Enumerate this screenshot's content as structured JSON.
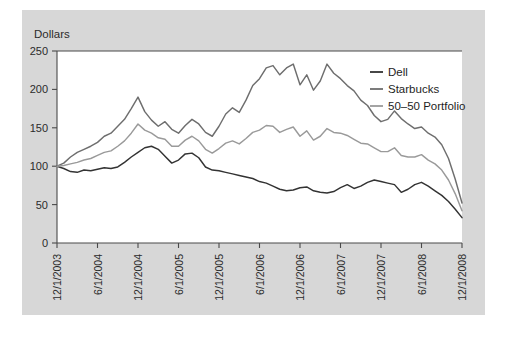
{
  "chart_data": {
    "type": "line",
    "title": "",
    "ylabel": "Dollars",
    "xlabel": "",
    "ylim": [
      0,
      250
    ],
    "yticks": [
      0,
      50,
      100,
      150,
      200,
      250
    ],
    "ytick_labels": [
      "0",
      "50",
      "100",
      "150",
      "200",
      "250"
    ],
    "grid": false,
    "legend_position": "top-right",
    "categories": [
      "12/1/2003",
      "1/1/2004",
      "2/1/2004",
      "3/1/2004",
      "4/1/2004",
      "5/1/2004",
      "6/1/2004",
      "7/1/2004",
      "8/1/2004",
      "9/1/2004",
      "10/1/2004",
      "11/1/2004",
      "12/1/2004",
      "1/1/2005",
      "2/1/2005",
      "3/1/2005",
      "4/1/2005",
      "5/1/2005",
      "6/1/2005",
      "7/1/2005",
      "8/1/2005",
      "9/1/2005",
      "10/1/2005",
      "11/1/2005",
      "12/1/2005",
      "1/1/2006",
      "2/1/2006",
      "3/1/2006",
      "4/1/2006",
      "5/1/2006",
      "6/1/2006",
      "7/1/2006",
      "8/1/2006",
      "9/1/2006",
      "10/1/2006",
      "11/1/2006",
      "12/1/2006",
      "1/1/2007",
      "2/1/2007",
      "3/1/2007",
      "4/1/2007",
      "5/1/2007",
      "6/1/2007",
      "7/1/2007",
      "8/1/2007",
      "9/1/2007",
      "10/1/2007",
      "11/1/2007",
      "12/1/2007",
      "1/1/2008",
      "2/1/2008",
      "3/1/2008",
      "4/1/2008",
      "5/1/2008",
      "6/1/2008",
      "7/1/2008",
      "8/1/2008",
      "9/1/2008",
      "10/1/2008",
      "11/1/2008",
      "12/1/2008"
    ],
    "xtick_labels": [
      "12/1/2003",
      "6/1/2004",
      "12/1/2004",
      "6/1/2005",
      "12/1/2005",
      "6/1/2006",
      "12/1/2006",
      "6/1/2007",
      "12/1/2007",
      "6/1/2008",
      "12/1/2008"
    ],
    "xtick_indices": [
      0,
      6,
      12,
      18,
      24,
      30,
      36,
      42,
      48,
      54,
      60
    ],
    "series": [
      {
        "name": "Dell",
        "color": "#333333",
        "values": [
          100,
          97,
          93,
          92,
          95,
          94,
          96,
          98,
          97,
          99,
          105,
          112,
          118,
          124,
          126,
          122,
          113,
          104,
          108,
          116,
          117,
          111,
          99,
          95,
          94,
          92,
          90,
          88,
          86,
          84,
          80,
          78,
          74,
          70,
          68,
          69,
          72,
          73,
          68,
          66,
          65,
          67,
          72,
          76,
          71,
          74,
          79,
          82,
          80,
          78,
          76,
          66,
          70,
          76,
          79,
          74,
          68,
          62,
          54,
          44,
          33
        ]
      },
      {
        "name": "Starbucks",
        "color": "#6e6e6e",
        "values": [
          100,
          104,
          112,
          118,
          122,
          126,
          131,
          139,
          143,
          152,
          161,
          175,
          190,
          171,
          160,
          152,
          158,
          148,
          143,
          153,
          161,
          155,
          144,
          139,
          152,
          168,
          176,
          170,
          186,
          205,
          214,
          228,
          231,
          219,
          228,
          233,
          206,
          219,
          199,
          211,
          233,
          221,
          214,
          205,
          198,
          186,
          179,
          166,
          158,
          161,
          172,
          162,
          155,
          149,
          151,
          143,
          138,
          128,
          110,
          83,
          52
        ]
      },
      {
        "name": "50–50 Portfolio",
        "color": "#9a9a9a",
        "values": [
          100,
          101,
          103,
          105,
          108,
          110,
          114,
          118,
          120,
          126,
          133,
          143,
          155,
          147,
          143,
          137,
          135,
          126,
          126,
          134,
          139,
          133,
          122,
          117,
          123,
          130,
          133,
          129,
          136,
          144,
          147,
          153,
          152,
          144,
          148,
          151,
          139,
          146,
          134,
          139,
          149,
          144,
          143,
          140,
          135,
          130,
          129,
          124,
          119,
          119,
          124,
          114,
          112,
          112,
          115,
          108,
          103,
          95,
          82,
          64,
          42
        ]
      }
    ]
  }
}
